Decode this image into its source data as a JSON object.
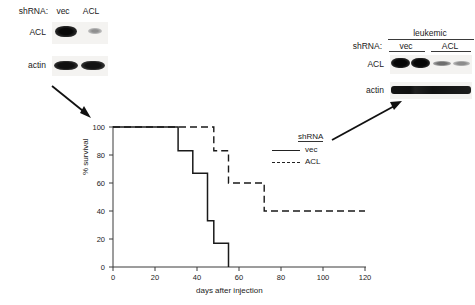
{
  "figure": {
    "panels": [
      "left-blot",
      "survival-chart",
      "leukemic-blot"
    ]
  },
  "left_blot": {
    "shrna_label": "shRNA:",
    "lanes": [
      "vec",
      "ACL"
    ],
    "rows": [
      {
        "label": "ACL",
        "intensities": [
          1.0,
          0.12
        ]
      },
      {
        "label": "actin",
        "intensities": [
          0.95,
          0.92
        ]
      }
    ]
  },
  "right_blot": {
    "group_label": "leukemic",
    "shrna_label": "shRNA:",
    "lanes": [
      "vec",
      "ACL"
    ],
    "rows": [
      {
        "label": "ACL",
        "intensities": [
          1.0,
          0.95,
          0.3,
          0.18
        ]
      },
      {
        "label": "actin",
        "intensities": [
          0.95,
          0.95,
          0.9,
          0.88
        ]
      }
    ]
  },
  "legend": {
    "title": "shRNA",
    "entries": [
      {
        "label": "vec",
        "style": "solid"
      },
      {
        "label": "ACL",
        "style": "dashed"
      }
    ]
  },
  "chart_data": {
    "type": "line",
    "title": "",
    "xlabel": "days after injection",
    "ylabel": "% survival",
    "xlim": [
      0,
      120
    ],
    "ylim": [
      0,
      100
    ],
    "xticks": [
      0,
      20,
      40,
      60,
      80,
      100,
      120
    ],
    "yticks": [
      0,
      20,
      40,
      60,
      80,
      100
    ],
    "grid": false,
    "legend_position": "right",
    "series": [
      {
        "name": "vec",
        "style": "solid",
        "x": [
          0,
          31,
          31,
          38,
          38,
          45,
          45,
          48,
          48,
          55,
          55
        ],
        "y": [
          100,
          100,
          83,
          83,
          67,
          67,
          33,
          33,
          17,
          17,
          0
        ]
      },
      {
        "name": "ACL",
        "style": "dashed",
        "x": [
          0,
          48,
          48,
          55,
          55,
          72,
          72,
          120
        ],
        "y": [
          100,
          100,
          83,
          83,
          60,
          60,
          40,
          40
        ]
      }
    ]
  },
  "annotations": {
    "arrow_to_chart": "arrow-down-right",
    "arrow_to_blot": "arrow-up-right"
  }
}
